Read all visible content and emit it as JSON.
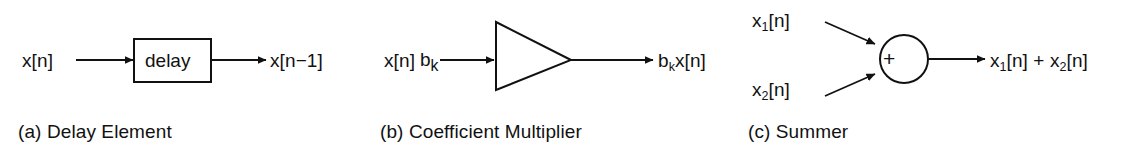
{
  "figure": {
    "background_color": "#ffffff",
    "stroke_color": "#111111",
    "text_color": "#111111",
    "panel_count": 3
  },
  "panels": [
    {
      "id": "delay-element",
      "caption": "(a) Delay Element",
      "block_shape": "rectangle",
      "block_label": "delay",
      "input_label": "x[n]",
      "output_label": "x[n−1]"
    },
    {
      "id": "coefficient-multiplier",
      "caption": "(b) Coefficient Multiplier",
      "block_shape": "triangle",
      "block_label_base": "b",
      "block_label_sub": "k",
      "input_label": "x[n]",
      "output_label_base": "b",
      "output_label_sub": "k",
      "output_label_tail": "x[n]"
    },
    {
      "id": "summer",
      "caption": "(c) Summer",
      "block_shape": "circle",
      "block_label": "+",
      "input_1_base": "x",
      "input_1_sub": "1",
      "input_1_tail": "[n]",
      "input_2_base": "x",
      "input_2_sub": "2",
      "input_2_tail": "[n]",
      "output_base_1": "x",
      "output_sub_1": "1",
      "output_mid": "[n] + x",
      "output_sub_2": "2",
      "output_tail": "[n]"
    }
  ]
}
